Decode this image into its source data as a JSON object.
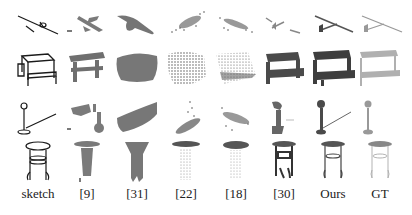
{
  "figure": {
    "columns": [
      {
        "label": "sketch",
        "style": "line-drawing"
      },
      {
        "label": "[9]",
        "style": "solid-blob"
      },
      {
        "label": "[31]",
        "style": "solid-smooth"
      },
      {
        "label": "[22]",
        "style": "point-cloud"
      },
      {
        "label": "[18]",
        "style": "point-cloud"
      },
      {
        "label": "[30]",
        "style": "solid-dark"
      },
      {
        "label": "Ours",
        "style": "solid-dark"
      },
      {
        "label": "GT",
        "style": "solid-light"
      }
    ],
    "rows": [
      {
        "category": "airplane"
      },
      {
        "category": "picnic-table"
      },
      {
        "category": "lamp"
      },
      {
        "category": "stool"
      }
    ],
    "colors": {
      "background": "#ffffff",
      "sketch_line": "#1a1a1a",
      "solid_gray": "#7a7a7a",
      "dark_gray": "#4a4a4a",
      "light_gray": "#aaaaaa",
      "label_text": "#222222"
    }
  }
}
